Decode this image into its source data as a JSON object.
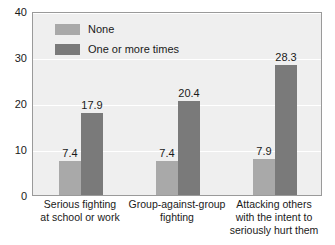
{
  "chart_data": {
    "type": "bar",
    "title": "",
    "subtitle": "",
    "xlabel": "",
    "ylabel": "",
    "ylim": [
      0,
      40
    ],
    "yticks": [
      0,
      10,
      20,
      30,
      40
    ],
    "grid": true,
    "legend_position": "inside top-left",
    "categories": [
      "Serious fighting\nat school or work",
      "Group-against-group\nfighting",
      "Attacking others\nwith the intent to\nseriously hurt them"
    ],
    "category_lines": [
      [
        "Serious fighting",
        "at school or work"
      ],
      [
        "Group-against-group",
        "fighting"
      ],
      [
        "Attacking others",
        "with the intent to",
        "seriously hurt them"
      ]
    ],
    "series": [
      {
        "name": "None",
        "color": "#a9a9a9",
        "values": [
          7.4,
          7.4,
          7.9
        ],
        "labels": [
          "7.4",
          "7.4",
          "7.9"
        ]
      },
      {
        "name": "One or more times",
        "color": "#7a7a7a",
        "values": [
          17.9,
          20.4,
          28.3
        ],
        "labels": [
          "17.9",
          "20.4",
          "28.3"
        ]
      }
    ]
  },
  "axis": {
    "y_tick_labels": [
      "40",
      "30",
      "20",
      "10",
      "0"
    ]
  },
  "legend": {
    "items": [
      {
        "label": "None",
        "swatch": "#a9a9a9"
      },
      {
        "label": "One or more times",
        "swatch": "#7a7a7a"
      }
    ]
  },
  "colors": {
    "plot_background": "#efefef",
    "plot_border": "#9a9a9a",
    "gridline": "#ffffff",
    "series_none": "#a9a9a9",
    "series_one_or_more": "#7a7a7a",
    "text": "#1a1a1a"
  }
}
